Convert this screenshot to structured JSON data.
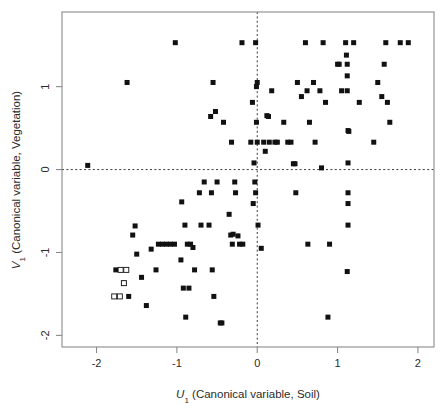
{
  "figure": {
    "background": "#ffffff",
    "frame_color": "#8a8a8a",
    "point_color": "#111111"
  },
  "chart_data": {
    "type": "scatter",
    "title": "",
    "xlabel": "U₁ (Canonical variable, Soil)",
    "ylabel": "V₁ (Canonical variable, Vegetation)",
    "xlabel_parts": {
      "var": "U",
      "sub": "1",
      "rest": " (Canonical variable, Soil)"
    },
    "ylabel_parts": {
      "var": "V",
      "sub": "1",
      "rest": " (Canonical variable, Vegetation)"
    },
    "xlim": [
      -2.43,
      2.2
    ],
    "ylim": [
      -2.14,
      1.9
    ],
    "xticks": [
      -2,
      -1,
      0,
      1,
      2
    ],
    "xtick_labels": [
      "-2",
      "-1",
      "0",
      "1",
      "2"
    ],
    "yticks": [
      1,
      0,
      -1,
      -2
    ],
    "ytick_labels": [
      "1",
      "0",
      "-1",
      "-2"
    ],
    "grid": false,
    "legend": "none",
    "reference_lines": [
      {
        "orientation": "horizontal",
        "value": 0,
        "style": "dashed"
      },
      {
        "orientation": "vertical",
        "value": 0,
        "style": "dashed"
      }
    ],
    "marker": {
      "filled": "square",
      "open": "open-square",
      "size_px": 5
    },
    "series": [
      {
        "name": "observations",
        "marker": "filled-square",
        "points": [
          [
            -2.11,
            0.05
          ],
          [
            -1.76,
            -1.21
          ],
          [
            -1.66,
            -1.37
          ],
          [
            -1.62,
            1.05
          ],
          [
            -1.6,
            -1.53
          ],
          [
            -1.55,
            -0.79
          ],
          [
            -1.52,
            -0.68
          ],
          [
            -1.5,
            -1.02
          ],
          [
            -1.44,
            -1.3
          ],
          [
            -1.38,
            -1.64
          ],
          [
            -1.32,
            -0.96
          ],
          [
            -1.26,
            -1.21
          ],
          [
            -1.23,
            -0.9
          ],
          [
            -1.18,
            -0.9
          ],
          [
            -1.13,
            -0.9
          ],
          [
            -1.08,
            -0.9
          ],
          [
            -1.03,
            -0.9
          ],
          [
            -1.02,
            1.53
          ],
          [
            -0.95,
            -1.09
          ],
          [
            -0.94,
            -0.39
          ],
          [
            -0.92,
            -1.43
          ],
          [
            -0.9,
            -0.67
          ],
          [
            -0.89,
            -1.78
          ],
          [
            -0.87,
            -0.9
          ],
          [
            -0.85,
            -1.43
          ],
          [
            -0.83,
            -0.9
          ],
          [
            -0.8,
            -0.94
          ],
          [
            -0.78,
            -1.21
          ],
          [
            -0.72,
            -0.28
          ],
          [
            -0.7,
            -0.67
          ],
          [
            -0.66,
            -0.15
          ],
          [
            -0.6,
            -0.67
          ],
          [
            -0.58,
            0.64
          ],
          [
            -0.57,
            -0.28
          ],
          [
            -0.56,
            -1.21
          ],
          [
            -0.55,
            1.05
          ],
          [
            -0.54,
            -1.53
          ],
          [
            -0.52,
            0.7
          ],
          [
            -0.5,
            -0.15
          ],
          [
            -0.46,
            -1.85
          ],
          [
            -0.44,
            -1.85
          ],
          [
            -0.42,
            0.57
          ],
          [
            -0.35,
            -0.54
          ],
          [
            -0.33,
            -0.79
          ],
          [
            -0.32,
            0.33
          ],
          [
            -0.31,
            -0.9
          ],
          [
            -0.3,
            -0.78
          ],
          [
            -0.28,
            -0.15
          ],
          [
            -0.27,
            -0.28
          ],
          [
            -0.24,
            -0.8
          ],
          [
            -0.22,
            -0.9
          ],
          [
            -0.19,
            1.53
          ],
          [
            -0.18,
            -0.9
          ],
          [
            -0.08,
            0.33
          ],
          [
            -0.06,
            0.81
          ],
          [
            -0.05,
            -0.41
          ],
          [
            -0.04,
            0.08
          ],
          [
            -0.03,
            -0.15
          ],
          [
            -0.02,
            -0.28
          ],
          [
            -0.02,
            1.53
          ],
          [
            -0.01,
            0.57
          ],
          [
            -0.01,
            1.0
          ],
          [
            0.0,
            1.05
          ],
          [
            0.0,
            0.33
          ],
          [
            0.01,
            -0.67
          ],
          [
            0.05,
            -0.95
          ],
          [
            0.08,
            0.33
          ],
          [
            0.1,
            0.22
          ],
          [
            0.12,
            0.65
          ],
          [
            0.14,
            0.64
          ],
          [
            0.15,
            0.33
          ],
          [
            0.18,
            0.95
          ],
          [
            0.22,
            0.33
          ],
          [
            0.25,
            0.33
          ],
          [
            0.33,
            0.57
          ],
          [
            0.38,
            0.33
          ],
          [
            0.42,
            0.33
          ],
          [
            0.45,
            0.07
          ],
          [
            0.47,
            0.07
          ],
          [
            0.48,
            -0.28
          ],
          [
            0.5,
            1.05
          ],
          [
            0.55,
            0.88
          ],
          [
            0.6,
            1.53
          ],
          [
            0.62,
            0.95
          ],
          [
            0.63,
            -0.9
          ],
          [
            0.65,
            0.57
          ],
          [
            0.7,
            1.05
          ],
          [
            0.72,
            0.33
          ],
          [
            0.78,
            0.95
          ],
          [
            0.8,
            0.02
          ],
          [
            0.82,
            1.53
          ],
          [
            0.85,
            0.81
          ],
          [
            0.88,
            -1.78
          ],
          [
            0.9,
            -0.9
          ],
          [
            1.0,
            1.27
          ],
          [
            1.02,
            1.27
          ],
          [
            1.05,
            0.95
          ],
          [
            1.1,
            1.53
          ],
          [
            1.11,
            1.38
          ],
          [
            1.12,
            1.27
          ],
          [
            1.12,
            1.13
          ],
          [
            1.12,
            0.95
          ],
          [
            1.13,
            0.47
          ],
          [
            1.14,
            0.46
          ],
          [
            1.13,
            0.08
          ],
          [
            1.13,
            -0.28
          ],
          [
            1.13,
            -0.41
          ],
          [
            1.13,
            -0.67
          ],
          [
            1.12,
            -1.23
          ],
          [
            1.2,
            1.53
          ],
          [
            1.27,
            0.81
          ],
          [
            1.45,
            0.33
          ],
          [
            1.5,
            1.05
          ],
          [
            1.55,
            0.88
          ],
          [
            1.58,
            1.27
          ],
          [
            1.6,
            1.53
          ],
          [
            1.62,
            0.81
          ],
          [
            1.65,
            0.57
          ],
          [
            1.78,
            1.53
          ],
          [
            1.88,
            1.53
          ]
        ]
      },
      {
        "name": "highlighted-observations",
        "marker": "open-square",
        "points": [
          [
            -1.7,
            -1.21
          ],
          [
            -1.63,
            -1.21
          ],
          [
            -1.66,
            -1.37
          ],
          [
            -1.78,
            -1.53
          ],
          [
            -1.71,
            -1.53
          ]
        ]
      }
    ]
  }
}
